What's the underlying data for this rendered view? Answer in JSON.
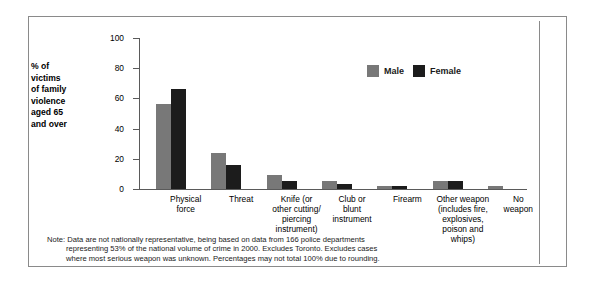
{
  "chart_data": {
    "type": "bar",
    "title": "",
    "xlabel": "",
    "ylabel": "% of victims of family violence aged 65 and over",
    "ylim": [
      0,
      100
    ],
    "yticks": [
      0,
      20,
      40,
      60,
      80,
      100
    ],
    "grid": false,
    "legend_position": "top-right",
    "categories": [
      "Physical force",
      "Threat",
      "Knife (or other cutting/ piercing instrument)",
      "Club or blunt instrument",
      "Firearm",
      "Other weapon (includes fire, explosives, poison and whips)",
      "No weapon"
    ],
    "category_lines": [
      [
        "Physical",
        "force"
      ],
      [
        "Threat"
      ],
      [
        "Knife (or",
        "other cutting/",
        "piercing",
        "instrument)"
      ],
      [
        "Club or",
        "blunt",
        "instrument"
      ],
      [
        "Firearm"
      ],
      [
        "Other weapon",
        "(includes fire,",
        "explosives,",
        "poison and",
        "whips)"
      ],
      [
        "No",
        "weapon"
      ]
    ],
    "series": [
      {
        "name": "Male",
        "color": "#787878",
        "values": [
          56,
          24,
          9,
          5,
          2,
          5,
          2
        ]
      },
      {
        "name": "Female",
        "color": "#1c1c1c",
        "values": [
          66,
          16,
          5,
          3,
          2,
          5,
          0
        ]
      }
    ]
  },
  "legend": {
    "male_label": "Male",
    "female_label": "Female"
  },
  "axis": {
    "tick_100": "100",
    "tick_80": "80",
    "tick_60": "60",
    "tick_40": "40",
    "tick_20": "20",
    "tick_0": "0"
  },
  "ylabel_lines": {
    "l1": "% of",
    "l2": "victims",
    "l3": "of family",
    "l4": "violence",
    "l5": "aged 65",
    "l6": "and over"
  },
  "note": {
    "line1": "Note: Data are not nationally representative, being based on data from 166 police departments",
    "line2": "representing 53% of the national volume of crime in 2000. Excludes Toronto. Excludes cases",
    "line3": "where most serious weapon was unknown. Percentages may not total 100% due to rounding."
  },
  "source": {
    "text": "Source: Statistics Canada. 2000. Centre for Justice Statistics, Incident-based Uniform Crime Reporting (UCR2) Survey."
  },
  "caption": {
    "text": ""
  }
}
